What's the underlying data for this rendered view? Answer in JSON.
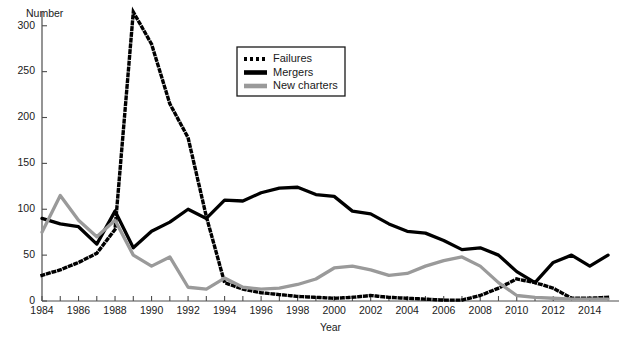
{
  "chart_data": {
    "type": "line",
    "title": "",
    "xlabel": "Year",
    "ylabel": "Number",
    "xlim": [
      1984,
      2015.6
    ],
    "ylim": [
      0,
      315
    ],
    "yticks": [
      0,
      50,
      100,
      150,
      200,
      250,
      300
    ],
    "ytick_labels": [
      "0",
      "50",
      "100",
      "150",
      "200",
      "250",
      "300"
    ],
    "xticks": [
      1984,
      1985,
      1986,
      1987,
      1988,
      1989,
      1990,
      1991,
      1992,
      1993,
      1994,
      1995,
      1996,
      1997,
      1998,
      1999,
      2000,
      2001,
      2002,
      2003,
      2004,
      2005,
      2006,
      2007,
      2008,
      2009,
      2010,
      2011,
      2012,
      2013,
      2014,
      2015
    ],
    "xtick_labels": [
      "1984",
      "",
      "1986",
      "",
      "1988",
      "",
      "1990",
      "",
      "1992",
      "",
      "1994",
      "",
      "1996",
      "",
      "1998",
      "",
      "2000",
      "",
      "2002",
      "",
      "2004",
      "",
      "2006",
      "",
      "2008",
      "",
      "2010",
      "",
      "2012",
      "",
      "2014",
      ""
    ],
    "grid": false,
    "legend_position": "upper-center",
    "x": [
      1984,
      1985,
      1986,
      1987,
      1988,
      1989,
      1990,
      1991,
      1992,
      1993,
      1994,
      1995,
      1996,
      1997,
      1998,
      1999,
      2000,
      2001,
      2002,
      2003,
      2004,
      2005,
      2006,
      2007,
      2008,
      2009,
      2010,
      2011,
      2012,
      2013,
      2014,
      2015
    ],
    "series": [
      {
        "name": "Failures",
        "color": "#000000",
        "style": "dotted",
        "values": [
          28,
          34,
          42,
          52,
          78,
          318,
          280,
          215,
          178,
          92,
          20,
          13,
          9,
          7,
          5,
          4,
          3,
          4,
          6,
          4,
          3,
          2,
          1,
          1,
          6,
          14,
          24,
          20,
          14,
          3,
          3,
          4
        ]
      },
      {
        "name": "Mergers",
        "color": "#000000",
        "style": "solid",
        "values": [
          90,
          84,
          81,
          62,
          98,
          58,
          76,
          86,
          100,
          90,
          110,
          109,
          118,
          123,
          124,
          116,
          114,
          98,
          95,
          84,
          76,
          74,
          66,
          56,
          58,
          50,
          32,
          20,
          42,
          50,
          38,
          50
        ]
      },
      {
        "name": "New charters",
        "color": "#9a9a9a",
        "style": "solid",
        "values": [
          75,
          115,
          88,
          70,
          88,
          50,
          38,
          48,
          15,
          13,
          25,
          15,
          13,
          14,
          18,
          24,
          36,
          38,
          34,
          28,
          30,
          38,
          44,
          48,
          38,
          20,
          6,
          4,
          3,
          2,
          2,
          2
        ]
      }
    ]
  },
  "legend": {
    "items": [
      {
        "label": "Failures"
      },
      {
        "label": "Mergers"
      },
      {
        "label": "New charters"
      }
    ]
  },
  "axes": {
    "y_title": "Number",
    "x_title": "Year"
  }
}
